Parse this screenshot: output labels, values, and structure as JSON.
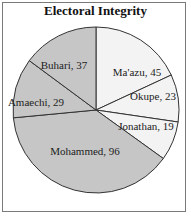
{
  "chart_data": {
    "type": "pie",
    "title": "Electoral Integrity",
    "start_angle": "12 o'clock, clockwise",
    "categories": [
      "Ma'azu",
      "Okupe",
      "Jonathan",
      "Mohammed",
      "Amaechi",
      "Buhari"
    ],
    "values": [
      45,
      23,
      19,
      96,
      29,
      37
    ],
    "labels": [
      "Ma'azu, 45",
      "Okupe, 23",
      "Jonathan, 19",
      "Mohammed, 96",
      "Amaechi, 29",
      "Buhari, 37"
    ],
    "colors": [
      "#f3f3f3",
      "#f3f3f3",
      "#f3f3f3",
      "#c6c6c6",
      "#c6c6c6",
      "#c6c6c6"
    ],
    "legend": "none (data labels inside slices)"
  },
  "pie": {
    "cx": 96,
    "cy": 110,
    "r": 83,
    "stroke": "#333333",
    "label_positions": [
      [
        137,
        73
      ],
      [
        153,
        97
      ],
      [
        146,
        127
      ],
      [
        85,
        152
      ],
      [
        36,
        103
      ],
      [
        64,
        66
      ]
    ]
  }
}
